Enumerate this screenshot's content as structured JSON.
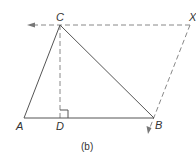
{
  "diagram": {
    "caption": "(b)",
    "points": {
      "A": {
        "label": "A"
      },
      "B": {
        "label": "B"
      },
      "C": {
        "label": "C"
      },
      "D": {
        "label": "D"
      },
      "X": {
        "label": "X"
      }
    },
    "segments": [
      {
        "from": "A",
        "to": "B",
        "style": "solid"
      },
      {
        "from": "A",
        "to": "C",
        "style": "solid"
      },
      {
        "from": "C",
        "to": "B",
        "style": "solid"
      },
      {
        "from": "C",
        "to": "D",
        "style": "dashed"
      },
      {
        "from": "X",
        "to": "C",
        "style": "dashed-arrow",
        "note": "arrow continues left beyond C"
      },
      {
        "from": "X",
        "to": "B",
        "style": "dashed-arrow",
        "note": "arrow continues below B"
      }
    ],
    "right_angle_at": "D",
    "colors": {
      "line": "#555555",
      "dashed": "#888888",
      "text": "#333333"
    }
  }
}
